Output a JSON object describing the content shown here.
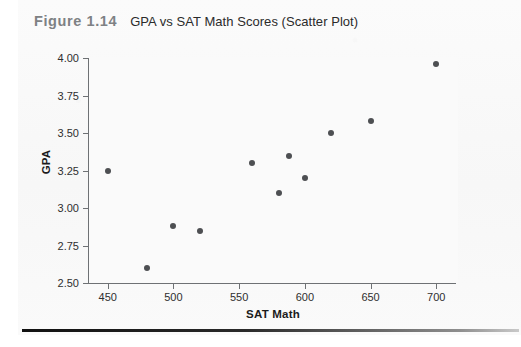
{
  "figure": {
    "number_label": "Figure 1.14",
    "title": "GPA vs SAT Math Scores (Scatter Plot)"
  },
  "colors": {
    "marker": "#4d4f52",
    "axis": "#6e7174",
    "caption_number": "#7e8184",
    "caption_title": "#2b2b2b",
    "plot_background": "#fafafa",
    "rule": "#111111"
  },
  "chart_data": {
    "type": "scatter",
    "title": "GPA vs SAT Math Scores (Scatter Plot)",
    "xlabel": "SAT Math",
    "ylabel": "GPA",
    "xlim": [
      435,
      715
    ],
    "ylim": [
      2.5,
      4.0
    ],
    "xticks": [
      450,
      500,
      550,
      600,
      650,
      700
    ],
    "xtick_labels": [
      "450",
      "500",
      "550",
      "600",
      "650",
      "700"
    ],
    "yticks": [
      2.5,
      2.75,
      3.0,
      3.25,
      3.5,
      3.75,
      4.0
    ],
    "ytick_labels": [
      "2.50",
      "2.75",
      "3.00",
      "3.25",
      "3.50",
      "3.75",
      "4.00"
    ],
    "grid": false,
    "legend": null,
    "marker_size": 6,
    "points": [
      {
        "x": 450,
        "y": 3.25
      },
      {
        "x": 480,
        "y": 2.6
      },
      {
        "x": 500,
        "y": 2.88
      },
      {
        "x": 520,
        "y": 2.85
      },
      {
        "x": 560,
        "y": 3.3
      },
      {
        "x": 580,
        "y": 3.1
      },
      {
        "x": 588,
        "y": 3.35
      },
      {
        "x": 600,
        "y": 3.2
      },
      {
        "x": 620,
        "y": 3.5
      },
      {
        "x": 650,
        "y": 3.58
      },
      {
        "x": 700,
        "y": 3.96
      }
    ]
  }
}
